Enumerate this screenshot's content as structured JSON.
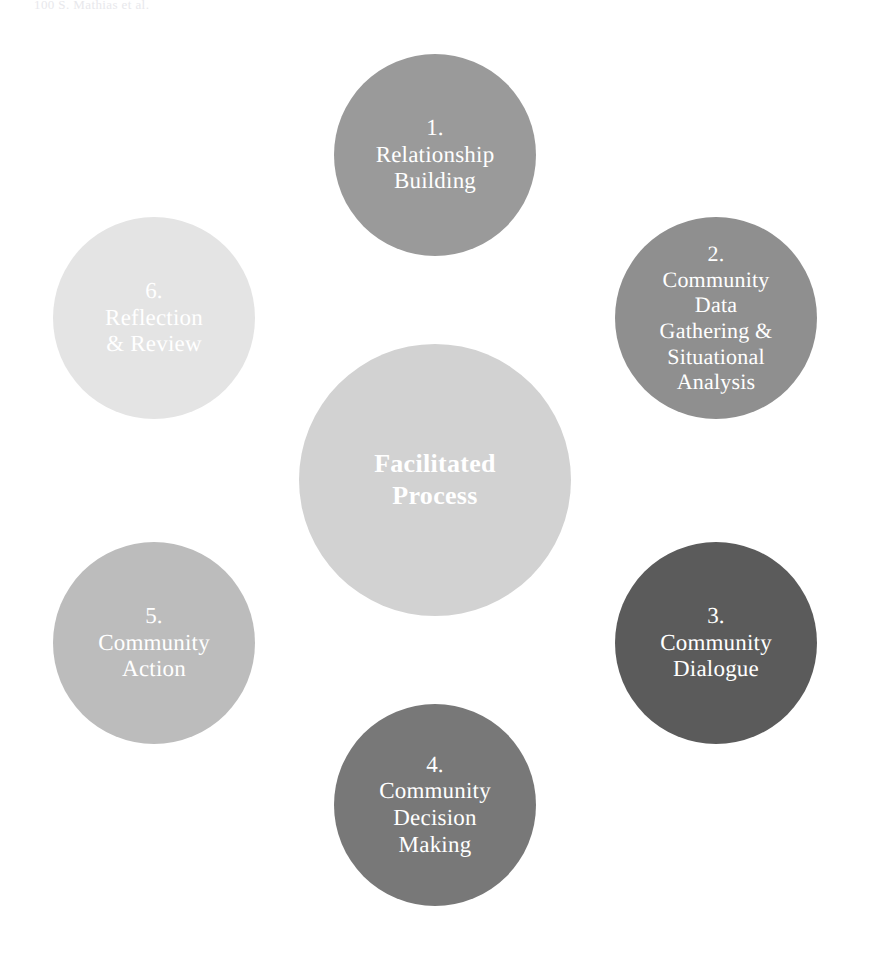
{
  "page": {
    "running_head": "100            S. Mathias et al.",
    "background_color": "#ffffff"
  },
  "diagram": {
    "type": "cycle",
    "title": "Facilitated Process",
    "center": {
      "label": "Facilitated\nProcess",
      "color": "#d2d2d2",
      "text_color": "#ffffff",
      "cx": 435,
      "cy": 480,
      "r": 136
    },
    "geometry": {
      "orbit_cx": 435,
      "orbit_cy": 480,
      "orbit_r": 325,
      "node_r": 101,
      "arc_r": 325,
      "arc_width": 26
    },
    "nodes": [
      {
        "step": "1.",
        "label": "1.\nRelationship\nBuilding",
        "name": "Relationship Building",
        "color": "#9a9a9a",
        "text_color": "#ffffff",
        "font_size": 23,
        "cx": 435,
        "cy": 155,
        "r": 101
      },
      {
        "step": "2.",
        "label": "2.\nCommunity\nData\nGathering &\nSituational\nAnalysis",
        "name": "Community Data Gathering & Situational Analysis",
        "color": "#8f8f8f",
        "text_color": "#ffffff",
        "font_size": 22,
        "cx": 716,
        "cy": 318,
        "r": 101
      },
      {
        "step": "3.",
        "label": "3.\nCommunity\nDialogue",
        "name": "Community Dialogue",
        "color": "#5b5b5b",
        "text_color": "#ffffff",
        "font_size": 23,
        "cx": 716,
        "cy": 643,
        "r": 101
      },
      {
        "step": "4.",
        "label": "4.\nCommunity\nDecision\nMaking",
        "name": "Community Decision Making",
        "color": "#787878",
        "text_color": "#ffffff",
        "font_size": 23,
        "cx": 435,
        "cy": 805,
        "r": 101
      },
      {
        "step": "5.",
        "label": "5.\nCommunity\nAction",
        "name": "Community Action",
        "color": "#bcbcbc",
        "text_color": "#ffffff",
        "font_size": 23,
        "cx": 154,
        "cy": 643,
        "r": 101
      },
      {
        "step": "6.",
        "label": "6.\nReflection\n& Review",
        "name": "Reflection & Review",
        "color": "#e4e4e4",
        "text_color": "#ffffff",
        "font_size": 23,
        "cx": 154,
        "cy": 318,
        "r": 101
      }
    ],
    "connectors": [
      {
        "from": 6,
        "to": 1,
        "color": "#6d6d6d",
        "start_deg": -130,
        "end_deg": -108
      },
      {
        "from": 1,
        "to": 2,
        "color": "#7e7e7e",
        "start_deg": -72,
        "end_deg": -50
      },
      {
        "from": 2,
        "to": 3,
        "color": "#c5c5c5",
        "start_deg": -12,
        "end_deg": 10
      },
      {
        "from": 3,
        "to": 4,
        "color": "#8b8b8b",
        "start_deg": 48,
        "end_deg": 70
      },
      {
        "from": 4,
        "to": 5,
        "color": "#cacaca",
        "start_deg": 108,
        "end_deg": 130
      },
      {
        "from": 5,
        "to": 6,
        "color": "#b6b6b6",
        "start_deg": 168,
        "end_deg": 190
      }
    ]
  }
}
